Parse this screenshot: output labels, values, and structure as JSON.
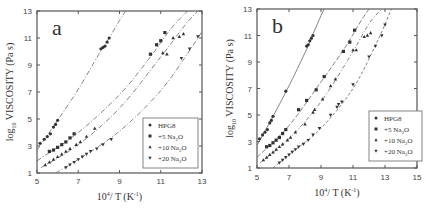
{
  "chart_data": [
    {
      "type": "scatter",
      "panel_label": "a",
      "xlabel": "10^4/ T (K^-1)",
      "ylabel": "log10 VISCOSITY (Pa s)",
      "xlim": [
        5,
        13
      ],
      "ylim": [
        1,
        13
      ],
      "xticks": [
        5,
        7,
        9,
        11,
        13
      ],
      "yticks": [
        1,
        3,
        5,
        7,
        9,
        11,
        13
      ],
      "grid": false,
      "legend_position": "lower right",
      "series": [
        {
          "name": "HPG8",
          "marker": "circle",
          "x": [
            5.15,
            5.35,
            5.5,
            5.65,
            5.8,
            5.9,
            6.0,
            8.1,
            8.2,
            8.3,
            8.4,
            8.5
          ],
          "y": [
            3.2,
            3.5,
            3.7,
            3.9,
            4.4,
            4.6,
            4.9,
            10.2,
            10.3,
            10.4,
            10.7,
            11.0
          ],
          "fit": {
            "x": [
              5.0,
              6.0,
              7.0,
              8.0,
              8.5,
              9.0,
              9.3
            ],
            "y": [
              2.7,
              4.9,
              7.2,
              9.8,
              11.0,
              12.3,
              13.0
            ]
          }
        },
        {
          "name": "+5 Na2O",
          "marker": "square",
          "x": [
            5.6,
            5.8,
            6.0,
            6.2,
            6.4,
            6.6,
            6.8,
            10.5,
            10.8,
            11.0,
            11.2
          ],
          "y": [
            2.6,
            2.7,
            2.9,
            3.1,
            3.3,
            3.6,
            3.9,
            9.8,
            10.5,
            10.8,
            11.4
          ],
          "fit": {
            "x": [
              5.0,
              7.0,
              9.0,
              10.5,
              11.5,
              12.3
            ],
            "y": [
              1.9,
              4.0,
              6.8,
              9.6,
              11.7,
              13.0
            ]
          }
        },
        {
          "name": "+10 Na2O",
          "marker": "triangle-up",
          "x": [
            5.4,
            5.6,
            5.8,
            6.0,
            6.2,
            6.4,
            6.6,
            6.9,
            7.1,
            7.4,
            7.8,
            11.1,
            11.3,
            11.6,
            11.9,
            12.1
          ],
          "y": [
            1.6,
            1.8,
            2.0,
            2.2,
            2.4,
            2.6,
            2.8,
            3.1,
            3.3,
            3.7,
            4.3,
            9.9,
            9.8,
            11.0,
            11.1,
            11.3
          ],
          "fit": {
            "x": [
              5.2,
              7.0,
              9.0,
              11.0,
              12.2,
              12.8
            ],
            "y": [
              1.4,
              3.1,
              5.8,
              9.6,
              12.0,
              13.0
            ]
          }
        },
        {
          "name": "+20 Na2O",
          "marker": "triangle-down",
          "x": [
            6.4,
            6.6,
            6.8,
            7.0,
            7.2,
            7.4,
            7.6,
            7.9,
            8.2,
            8.6,
            12.0,
            12.4,
            12.8
          ],
          "y": [
            1.4,
            1.6,
            1.8,
            2.0,
            2.2,
            2.4,
            2.6,
            2.8,
            3.1,
            3.5,
            9.5,
            10.2,
            11.1
          ],
          "fit": {
            "x": [
              5.9,
              7.0,
              9.0,
              11.0,
              12.5,
              13.0
            ],
            "y": [
              1.0,
              2.0,
              4.1,
              7.1,
              10.3,
              11.5
            ]
          }
        }
      ]
    },
    {
      "type": "scatter",
      "panel_label": "b",
      "xlabel": "10^4/ T (K^-1)",
      "ylabel": "log10 VISCOSITY (Pa s)",
      "xlim": [
        5,
        15
      ],
      "ylim": [
        1,
        13
      ],
      "xticks": [
        5,
        7,
        9,
        11,
        13,
        15
      ],
      "yticks": [
        1,
        3,
        5,
        7,
        9,
        11,
        13
      ],
      "grid": false,
      "legend_position": "lower right",
      "series": [
        {
          "name": "HPG8",
          "marker": "circle",
          "x": [
            5.15,
            5.35,
            5.5,
            5.65,
            5.8,
            5.9,
            6.0,
            6.8,
            8.1,
            8.2,
            8.3,
            8.4,
            8.5
          ],
          "y": [
            3.2,
            3.5,
            3.7,
            3.9,
            4.4,
            4.6,
            4.9,
            6.8,
            10.2,
            10.3,
            10.6,
            10.8,
            11.0
          ],
          "fit": {
            "x": [
              5.0,
              6.0,
              7.0,
              8.0,
              8.5,
              9.0,
              9.2
            ],
            "y": [
              2.7,
              4.9,
              7.2,
              9.7,
              11.1,
              12.5,
              13.0
            ]
          }
        },
        {
          "name": "+5 Na2O",
          "marker": "square",
          "x": [
            5.6,
            5.8,
            6.0,
            6.2,
            6.4,
            6.6,
            6.8,
            7.6,
            8.1,
            8.7,
            9.2,
            10.4,
            10.8,
            11.1
          ],
          "y": [
            2.6,
            2.7,
            2.9,
            3.1,
            3.3,
            3.6,
            3.9,
            5.4,
            6.1,
            6.9,
            7.9,
            9.8,
            10.5,
            11.4
          ],
          "fit": {
            "x": [
              5.0,
              7.0,
              9.0,
              10.5,
              11.5,
              12.0
            ],
            "y": [
              1.8,
              4.2,
              7.5,
              10.1,
              12.1,
              13.0
            ]
          }
        },
        {
          "name": "+10 Na2O",
          "marker": "triangle-up",
          "x": [
            5.4,
            5.6,
            5.8,
            6.0,
            6.2,
            6.4,
            6.6,
            6.9,
            7.1,
            7.4,
            8.0,
            8.5,
            8.6,
            9.1,
            9.6,
            9.9,
            11.0,
            11.2,
            11.7,
            11.9,
            12.1
          ],
          "y": [
            1.6,
            1.8,
            2.0,
            2.2,
            2.4,
            2.6,
            2.8,
            3.1,
            3.3,
            3.7,
            4.3,
            5.2,
            5.4,
            6.2,
            7.2,
            7.7,
            9.9,
            9.9,
            10.9,
            11.0,
            11.2
          ],
          "fit": {
            "x": [
              5.2,
              7.0,
              9.0,
              11.0,
              12.0,
              12.8
            ],
            "y": [
              1.4,
              3.2,
              6.0,
              9.8,
              11.9,
              13.0
            ]
          }
        },
        {
          "name": "+20 Na2O",
          "marker": "triangle-down",
          "x": [
            6.4,
            6.6,
            6.8,
            7.0,
            7.2,
            7.4,
            7.6,
            7.9,
            8.2,
            8.5,
            8.9,
            9.6,
            10.0,
            10.1,
            10.3,
            11.0,
            12.0,
            12.4,
            12.8,
            13.0
          ],
          "y": [
            1.4,
            1.6,
            1.8,
            2.0,
            2.2,
            2.4,
            2.6,
            2.8,
            3.1,
            3.5,
            4.0,
            5.0,
            5.6,
            5.8,
            6.0,
            7.3,
            9.4,
            10.2,
            11.0,
            11.8
          ],
          "fit": {
            "x": [
              6.0,
              7.0,
              9.0,
              11.0,
              12.5,
              13.4
            ],
            "y": [
              1.0,
              2.0,
              4.0,
              7.0,
              10.5,
              13.0
            ]
          }
        }
      ]
    }
  ],
  "panels": [
    {
      "letter": "a",
      "xlabel": "10",
      "xlabel_sup": "4",
      "xlabel_rest": "/ T (K",
      "xlabel_sup2": "-1",
      "xlabel_end": ")",
      "ylabel_main": "log",
      "ylabel_sub": "10",
      "ylabel_rest": " VISCOSITY (Pa s)"
    },
    {
      "letter": "b",
      "xlabel": "10",
      "xlabel_sup": "4",
      "xlabel_rest": "/ T (K",
      "xlabel_sup2": "-1",
      "xlabel_end": ")",
      "ylabel_main": "log",
      "ylabel_sub": "10",
      "ylabel_rest": " VISCOSITY (Pa s)"
    }
  ],
  "legend": [
    {
      "label": "HPG8",
      "marker": "circle"
    },
    {
      "label": "+5 Na",
      "sub": "2",
      "after": "O",
      "marker": "square"
    },
    {
      "label": "+10 Na",
      "sub": "2",
      "after": "O",
      "marker": "triangle-up"
    },
    {
      "label": "+20 Na",
      "sub": "2",
      "after": "O",
      "marker": "triangle-down"
    }
  ],
  "colors": {
    "ink": "#333333",
    "axis": "#444444",
    "background": "#ffffff"
  }
}
